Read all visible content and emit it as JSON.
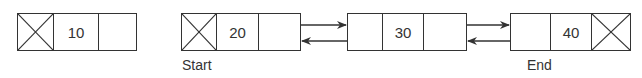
{
  "diagram": {
    "type": "linked-list-illustration",
    "standalone_node": {
      "value": "10",
      "prev": "null",
      "next": "empty"
    },
    "doubly_linked_list": {
      "nodes": [
        {
          "value": "20",
          "prev": "null",
          "next": "pointer"
        },
        {
          "value": "30",
          "prev": "pointer",
          "next": "pointer"
        },
        {
          "value": "40",
          "prev": "pointer",
          "next": "null"
        }
      ],
      "labels": {
        "start": "Start",
        "end": "End"
      },
      "links": [
        {
          "from": "20",
          "to": "30",
          "direction": "forward"
        },
        {
          "from": "30",
          "to": "20",
          "direction": "backward"
        },
        {
          "from": "30",
          "to": "40",
          "direction": "forward"
        },
        {
          "from": "40",
          "to": "30",
          "direction": "backward"
        }
      ]
    },
    "colors": {
      "stroke": "#333333",
      "background": "#ffffff"
    }
  }
}
